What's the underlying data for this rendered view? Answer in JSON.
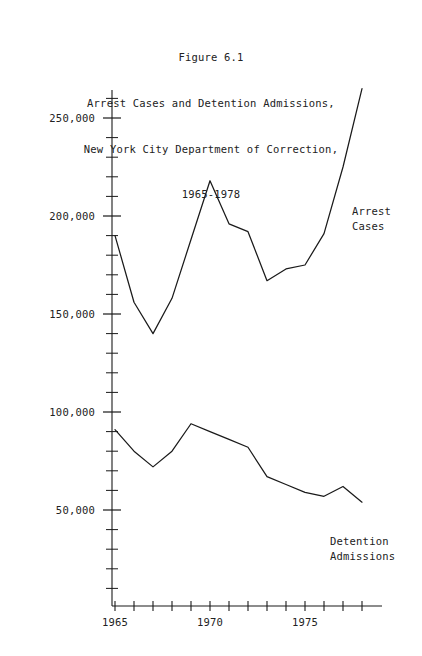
{
  "figure": {
    "title_lines": [
      "Figure 6.1",
      "Arrest Cases and Detention Admissions,",
      "New York City Department of Correction,",
      "1965-1978"
    ],
    "corner_artifact": "   "
  },
  "chart_data": {
    "type": "line",
    "title": "Figure 6.1 Arrest Cases and Detention Admissions, New York City Department of Correction, 1965-1978",
    "xlabel": "",
    "ylabel": "",
    "xlim": [
      1964.5,
      1978.5
    ],
    "ylim": [
      0,
      280000
    ],
    "grid": false,
    "legend_position": "inline-right",
    "x": [
      1965,
      1966,
      1967,
      1968,
      1969,
      1970,
      1971,
      1972,
      1973,
      1974,
      1975,
      1976,
      1977,
      1978
    ],
    "xticks": [
      1965,
      1966,
      1967,
      1968,
      1969,
      1970,
      1971,
      1972,
      1973,
      1974,
      1975,
      1976,
      1977,
      1978
    ],
    "xtick_labels": [
      "1965",
      "",
      "",
      "",
      "",
      "1970",
      "",
      "",
      "",
      "",
      "1975",
      "",
      "",
      ""
    ],
    "yticks": [
      10000,
      20000,
      30000,
      40000,
      50000,
      60000,
      70000,
      80000,
      90000,
      100000,
      110000,
      120000,
      130000,
      140000,
      150000,
      160000,
      170000,
      180000,
      190000,
      200000,
      210000,
      220000,
      230000,
      240000,
      250000,
      260000,
      270000
    ],
    "ytick_labels_shown": [
      "50,000",
      "100,000",
      "150,000",
      "200,000",
      "250,000"
    ],
    "ytick_labeled_values": [
      50000,
      100000,
      150000,
      200000,
      250000
    ],
    "series": [
      {
        "name": "Arrest Cases",
        "label_lines": [
          "Arrest",
          "Cases"
        ],
        "color": "#1a1a1a",
        "values": [
          190000,
          156000,
          140000,
          158000,
          188000,
          218000,
          196000,
          192000,
          167000,
          173000,
          175000,
          191000,
          225000,
          265000
        ]
      },
      {
        "name": "Detention Admissions",
        "label_lines": [
          "Detention",
          "Admissions"
        ],
        "color": "#1a1a1a",
        "values": [
          91000,
          80000,
          72000,
          80000,
          94000,
          90000,
          86000,
          82000,
          67000,
          63000,
          59000,
          57000,
          62000,
          54000
        ]
      }
    ]
  }
}
